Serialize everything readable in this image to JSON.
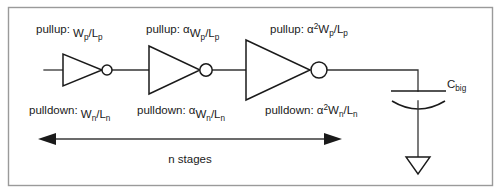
{
  "figure": {
    "border_color": "#9a9a9a",
    "line_color": "#1a1a1a"
  },
  "stages": [
    {
      "index": 1,
      "pullup_prefix": "pullup: ",
      "pullup_alpha": "",
      "pullup_exp": "",
      "pullup_num": "W",
      "pullup_num_sub": "p",
      "pullup_slash": "/L",
      "pullup_den_sub": "p",
      "pulldown_prefix": "pulldown: ",
      "pulldown_alpha": "",
      "pulldown_exp": "",
      "pulldown_num": "W",
      "pulldown_num_sub": "n",
      "pulldown_slash": "/L",
      "pulldown_den_sub": "n"
    },
    {
      "index": 2,
      "pullup_prefix": "pullup: ",
      "pullup_alpha": "α",
      "pullup_exp": "",
      "pullup_num": "W",
      "pullup_num_sub": "p",
      "pullup_slash": "/L",
      "pullup_den_sub": "p",
      "pulldown_prefix": "pulldown: ",
      "pulldown_alpha": "α",
      "pulldown_exp": "",
      "pulldown_num": "W",
      "pulldown_num_sub": "n",
      "pulldown_slash": "/L",
      "pulldown_den_sub": "n"
    },
    {
      "index": 3,
      "pullup_prefix": "pullup: ",
      "pullup_alpha": "α",
      "pullup_exp": "2",
      "pullup_num": "W",
      "pullup_num_sub": "p",
      "pullup_slash": "/L",
      "pullup_den_sub": "p",
      "pulldown_prefix": "pulldown: ",
      "pulldown_alpha": "α",
      "pulldown_exp": "2",
      "pulldown_num": "W",
      "pulldown_num_sub": "n",
      "pulldown_slash": "/L",
      "pulldown_den_sub": "n"
    }
  ],
  "load": {
    "symbol": "C",
    "subscript": "big"
  },
  "span": {
    "label": "n stages"
  }
}
